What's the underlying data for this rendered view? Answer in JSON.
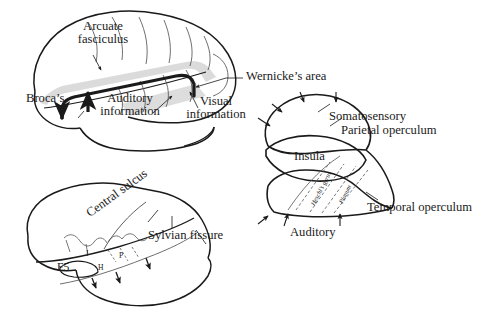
{
  "figure": {
    "background": "#ffffff",
    "ink": "#1a1a1a",
    "shade": "#d9d9d9"
  },
  "panels": {
    "top_left": {
      "name": "language-pathway-lateral-view",
      "labels": {
        "arcuate_line1": "Arcuate",
        "arcuate_line2": "fasciculus",
        "brocas": "Broca’s",
        "auditory_line1": "Auditory",
        "auditory_line2": "information",
        "visual_line1": "Visual",
        "visual_line2": "information",
        "wernickes": "Wernicke’s area"
      }
    },
    "right": {
      "name": "opercula-insula-unfolded-view",
      "labels": {
        "somatosensory": "Somatosensory",
        "parietal_operculum": "Parietal operculum",
        "insula": "Insula",
        "heschls_gyrus": "Heschl’s gyrus",
        "planum": "Planum",
        "temporal_operculum": "Temporal operculum",
        "auditory": "Auditory"
      },
      "arrow_counts": {
        "superior": 4,
        "inferior": 3
      }
    },
    "bottom_left": {
      "name": "macaque-lateral-view",
      "labels": {
        "central_sulcus": "Central sulcus",
        "sylvian_fissure": "Sylvian fissure",
        "f5": "F5",
        "area_i": "I",
        "area_p": "P",
        "area_h": "H"
      }
    }
  }
}
